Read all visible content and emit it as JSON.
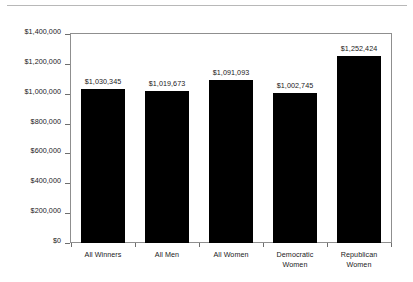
{
  "chart_data": {
    "type": "bar",
    "title": "",
    "subtitle": "",
    "xlabel": "",
    "ylabel": "",
    "ylim": [
      0,
      1400000
    ],
    "grid": false,
    "legend": "none",
    "orientation": "vertical",
    "bar_color": "#000000",
    "frame_color": "#8f8f8f",
    "categories": [
      "All Winners",
      "All Men",
      "All Women",
      "Democratic Women",
      "Republican Women"
    ],
    "category_lines": [
      [
        "All Winners"
      ],
      [
        "All Men"
      ],
      [
        "All Women"
      ],
      [
        "Democratic",
        "Women"
      ],
      [
        "Republican",
        "Women"
      ]
    ],
    "values": [
      1030345,
      1019673,
      1091093,
      1002745,
      1252424
    ],
    "value_labels": [
      "$1,030,345",
      "$1,019,673",
      "$1,091,093",
      "$1,002,745",
      "$1,252,424"
    ],
    "y_ticks": [
      1400000,
      1200000,
      1000000,
      800000,
      600000,
      400000,
      200000,
      0
    ],
    "y_tick_labels": [
      "$1,400,000",
      "$1,200,000",
      "$1,000,000",
      "$800,000",
      "$600,000",
      "$400,000",
      "$200,000",
      "$0"
    ]
  }
}
